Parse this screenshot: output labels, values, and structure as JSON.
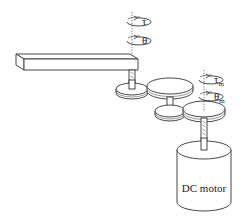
{
  "diagram": {
    "type": "mechanical-schematic",
    "labels": {
      "output_torque": "τ",
      "output_angle": "θ",
      "motor_torque": "τ",
      "motor_torque_sub": "m",
      "motor_angle": "θ",
      "motor_angle_sub": "m",
      "motor": "DC motor"
    },
    "components": [
      "arm-link",
      "output-shaft",
      "gear-1",
      "gear-2",
      "gear-3",
      "gear-4",
      "motor-shaft",
      "dc-motor"
    ],
    "colors": {
      "line": "#333333",
      "background": "#ffffff"
    }
  }
}
